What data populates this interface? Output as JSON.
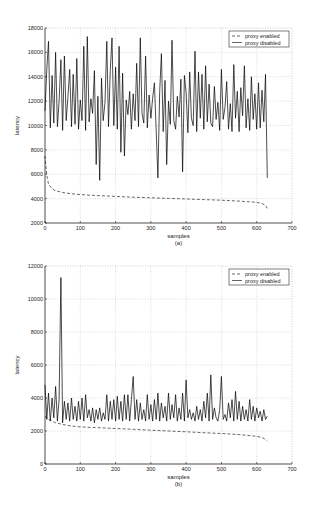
{
  "chart_data": [
    {
      "id": "a",
      "type": "line",
      "caption": "(a)",
      "title": "",
      "xlabel": "samples",
      "ylabel": "latency",
      "xlim": [
        0,
        700
      ],
      "ylim": [
        2000,
        18000
      ],
      "xticks": [
        0,
        100,
        200,
        300,
        400,
        500,
        600,
        700
      ],
      "yticks": [
        2000,
        4000,
        6000,
        8000,
        10000,
        12000,
        14000,
        16000,
        18000
      ],
      "grid": true,
      "legend": {
        "position": "upper right",
        "entries": [
          "proxy enabled",
          "proxy disabled"
        ]
      },
      "series": [
        {
          "name": "proxy enabled",
          "style": "dashed",
          "x": [
            0,
            2,
            5,
            10,
            20,
            30,
            50,
            75,
            100,
            150,
            200,
            250,
            300,
            350,
            400,
            450,
            500,
            550,
            600,
            615,
            625,
            630
          ],
          "values": [
            7500,
            6800,
            5900,
            5200,
            4800,
            4650,
            4500,
            4400,
            4330,
            4250,
            4180,
            4120,
            4070,
            4020,
            3970,
            3920,
            3870,
            3800,
            3700,
            3600,
            3450,
            3200
          ]
        },
        {
          "name": "proxy disabled",
          "style": "solid",
          "x": [
            0,
            5,
            10,
            15,
            20,
            25,
            30,
            35,
            40,
            45,
            50,
            55,
            60,
            65,
            70,
            75,
            80,
            85,
            90,
            95,
            100,
            105,
            110,
            115,
            120,
            125,
            130,
            135,
            140,
            145,
            150,
            155,
            160,
            165,
            170,
            175,
            180,
            185,
            190,
            195,
            200,
            205,
            210,
            215,
            220,
            225,
            230,
            235,
            240,
            245,
            250,
            255,
            260,
            265,
            270,
            275,
            280,
            285,
            290,
            295,
            300,
            305,
            310,
            315,
            320,
            325,
            330,
            335,
            340,
            345,
            350,
            355,
            360,
            365,
            370,
            375,
            380,
            385,
            390,
            395,
            400,
            405,
            410,
            415,
            420,
            425,
            430,
            435,
            440,
            445,
            450,
            455,
            460,
            465,
            470,
            475,
            480,
            485,
            490,
            495,
            500,
            505,
            510,
            515,
            520,
            525,
            530,
            535,
            540,
            545,
            550,
            555,
            560,
            565,
            570,
            575,
            580,
            585,
            590,
            595,
            600,
            605,
            610,
            615,
            620,
            625,
            630
          ],
          "values": [
            11200,
            14600,
            16900,
            9800,
            14100,
            10200,
            16000,
            9900,
            12000,
            15400,
            9600,
            15700,
            10400,
            12300,
            14600,
            9900,
            14200,
            10100,
            15500,
            9700,
            12100,
            10400,
            16500,
            9600,
            17300,
            10300,
            12200,
            11000,
            14500,
            6800,
            12400,
            5500,
            13900,
            10400,
            11900,
            16900,
            9900,
            14600,
            17200,
            10000,
            14800,
            9700,
            16500,
            7800,
            14300,
            7500,
            12100,
            10900,
            12800,
            9700,
            12600,
            10400,
            15100,
            9900,
            17200,
            11000,
            10200,
            15700,
            9800,
            12500,
            10600,
            12200,
            13500,
            9600,
            5700,
            12800,
            15900,
            9500,
            13700,
            6800,
            12000,
            10100,
            17000,
            10400,
            9700,
            12400,
            10700,
            13800,
            6200,
            14100,
            12700,
            9400,
            14400,
            10600,
            10000,
            16100,
            9500,
            14400,
            10600,
            14200,
            9700,
            14900,
            10300,
            13400,
            10200,
            9900,
            13200,
            10500,
            11900,
            9600,
            14600,
            10500,
            11500,
            13600,
            9700,
            11800,
            9500,
            15000,
            10600,
            12800,
            9500,
            13100,
            10800,
            14900,
            9800,
            12200,
            9600,
            14000,
            10500,
            12600,
            9700,
            13500,
            9800,
            12900,
            10300,
            14200,
            5700
          ]
        }
      ]
    },
    {
      "id": "b",
      "type": "line",
      "caption": "(b)",
      "title": "",
      "xlabel": "samples",
      "ylabel": "latency",
      "xlim": [
        0,
        700
      ],
      "ylim": [
        0,
        12000
      ],
      "xticks": [
        0,
        100,
        200,
        300,
        400,
        500,
        600,
        700
      ],
      "yticks": [
        0,
        2000,
        4000,
        6000,
        8000,
        10000,
        12000
      ],
      "grid": true,
      "legend": {
        "position": "upper right",
        "entries": [
          "proxy enabled",
          "proxy disabled"
        ]
      },
      "series": [
        {
          "name": "proxy enabled",
          "style": "dashed",
          "x": [
            0,
            10,
            20,
            30,
            50,
            75,
            100,
            150,
            200,
            250,
            300,
            350,
            400,
            450,
            500,
            550,
            600,
            615,
            625,
            630
          ],
          "values": [
            2900,
            2700,
            2600,
            2500,
            2400,
            2300,
            2250,
            2200,
            2150,
            2100,
            2050,
            2000,
            1950,
            1900,
            1850,
            1780,
            1680,
            1600,
            1500,
            1400
          ]
        },
        {
          "name": "proxy disabled",
          "style": "solid",
          "x": [
            0,
            5,
            10,
            15,
            20,
            25,
            30,
            35,
            40,
            45,
            50,
            55,
            60,
            65,
            70,
            75,
            80,
            85,
            90,
            95,
            100,
            105,
            110,
            115,
            120,
            125,
            130,
            135,
            140,
            145,
            150,
            155,
            160,
            165,
            170,
            175,
            180,
            185,
            190,
            195,
            200,
            205,
            210,
            215,
            220,
            225,
            230,
            235,
            240,
            245,
            250,
            255,
            260,
            265,
            270,
            275,
            280,
            285,
            290,
            295,
            300,
            305,
            310,
            315,
            320,
            325,
            330,
            335,
            340,
            345,
            350,
            355,
            360,
            365,
            370,
            375,
            380,
            385,
            390,
            395,
            400,
            405,
            410,
            415,
            420,
            425,
            430,
            435,
            440,
            445,
            450,
            455,
            460,
            465,
            470,
            475,
            480,
            485,
            490,
            495,
            500,
            505,
            510,
            515,
            520,
            525,
            530,
            535,
            540,
            545,
            550,
            555,
            560,
            565,
            570,
            575,
            580,
            585,
            590,
            595,
            600,
            605,
            610,
            615,
            620,
            625,
            630
          ],
          "values": [
            4800,
            2700,
            4300,
            2600,
            4000,
            2800,
            4700,
            2600,
            3900,
            11300,
            2500,
            3800,
            2700,
            3700,
            2600,
            4000,
            2700,
            3500,
            2600,
            3800,
            2700,
            4000,
            2600,
            4200,
            2800,
            3300,
            2600,
            3400,
            2500,
            3300,
            2700,
            3400,
            2600,
            3100,
            2700,
            4200,
            2600,
            3800,
            2700,
            3900,
            2600,
            4100,
            2700,
            3800,
            2600,
            4200,
            2700,
            4200,
            2600,
            3900,
            5300,
            2700,
            3900,
            2600,
            3700,
            2700,
            3300,
            2600,
            4200,
            2700,
            3600,
            2600,
            3900,
            2700,
            4300,
            2600,
            3700,
            2800,
            3500,
            2600,
            4300,
            2700,
            3600,
            2800,
            4200,
            2600,
            3400,
            2700,
            4300,
            2600,
            5100,
            2800,
            3300,
            2700,
            3100,
            2600,
            3500,
            2700,
            3300,
            2600,
            3800,
            2800,
            4300,
            2600,
            5400,
            2700,
            3400,
            2800,
            2600,
            3300,
            5300,
            2700,
            3000,
            2600,
            3700,
            2800,
            3900,
            2600,
            4400,
            2700,
            3800,
            2600,
            3500,
            2700,
            3300,
            2600,
            3900,
            2700,
            3500,
            2600,
            3400,
            2800,
            3200,
            2600,
            3300,
            2700,
            2900
          ]
        }
      ]
    }
  ]
}
